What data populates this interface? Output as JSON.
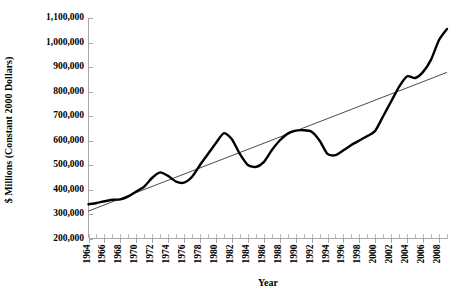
{
  "chart_data": {
    "type": "line",
    "title": "",
    "xlabel": "Year",
    "ylabel": "$ Millions (Constant 2000 Dollars)",
    "xlim": [
      1964,
      2009
    ],
    "ylim": [
      200000,
      1100000
    ],
    "grid": false,
    "legend": "none",
    "y_ticks": [
      200000,
      300000,
      400000,
      500000,
      600000,
      700000,
      800000,
      900000,
      1000000,
      1100000
    ],
    "y_tick_labels": [
      "200,000",
      "300,000",
      "400,000",
      "500,000",
      "600,000",
      "700,000",
      "800,000",
      "900,000",
      "1,000,000",
      "1,100,000"
    ],
    "x_ticks": [
      1964,
      1966,
      1968,
      1970,
      1972,
      1974,
      1976,
      1978,
      1980,
      1982,
      1984,
      1986,
      1988,
      1990,
      1992,
      1994,
      1996,
      1998,
      2000,
      2002,
      2004,
      2006,
      2008
    ],
    "x_tick_labels": [
      "1964",
      "1966",
      "1968",
      "1970",
      "1972",
      "1974",
      "1976",
      "1978",
      "1980",
      "1982",
      "1984",
      "1986",
      "1988",
      "1990",
      "1992",
      "1994",
      "1996",
      "1998",
      "2000",
      "2002",
      "2004",
      "2006",
      "2008"
    ],
    "x_minor_step": 1,
    "series": [
      {
        "name": "value",
        "style": "thick-black-line",
        "color": "#000000",
        "x": [
          1964,
          1965,
          1966,
          1967,
          1968,
          1969,
          1970,
          1971,
          1972,
          1973,
          1974,
          1975,
          1976,
          1977,
          1978,
          1979,
          1980,
          1981,
          1982,
          1983,
          1984,
          1985,
          1986,
          1987,
          1988,
          1989,
          1990,
          1991,
          1992,
          1993,
          1994,
          1995,
          1996,
          1997,
          1998,
          1999,
          2000,
          2001,
          2002,
          2003,
          2004,
          2005,
          2006,
          2007,
          2008,
          2009
        ],
        "values": [
          340000,
          345000,
          352000,
          358000,
          360000,
          372000,
          392000,
          412000,
          448000,
          470000,
          455000,
          432000,
          428000,
          452000,
          500000,
          545000,
          590000,
          630000,
          605000,
          545000,
          500000,
          492000,
          512000,
          560000,
          600000,
          628000,
          640000,
          642000,
          636000,
          600000,
          545000,
          540000,
          560000,
          582000,
          600000,
          618000,
          640000,
          700000,
          760000,
          820000,
          862000,
          855000,
          880000,
          930000,
          1010000,
          1055000
        ]
      },
      {
        "name": "trend",
        "style": "thin-black-straight-line",
        "color": "#1a1a1a",
        "x": [
          1964,
          2009
        ],
        "values": [
          312000,
          878000
        ]
      }
    ]
  }
}
